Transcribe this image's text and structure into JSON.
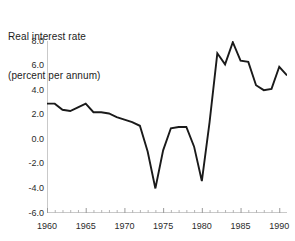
{
  "chart_data": {
    "type": "line",
    "title": "Real interest rate",
    "subtitle": "(percent per annum)",
    "title_lines": [
      "Real interest rate",
      "(percent per annum)"
    ],
    "xlabel": "",
    "ylabel": "",
    "ylim": [
      -6.0,
      8.0
    ],
    "xlim": [
      1960,
      1991
    ],
    "grid": false,
    "legend": null,
    "y_ticks": [
      8.0,
      6.0,
      4.0,
      2.0,
      0.0,
      -2.0,
      -4.0,
      -6.0
    ],
    "y_tick_labels": [
      "8.0",
      "6.0",
      "4.0",
      "2.0",
      "0.0",
      "-2.0",
      "-4.0",
      "-6.0"
    ],
    "x_ticks_major": [
      1960,
      1965,
      1970,
      1975,
      1980,
      1985,
      1990
    ],
    "x_tick_labels": [
      "1960",
      "1965",
      "1970",
      "1975",
      "1980",
      "1985",
      "1990"
    ],
    "x_minor_tick_interval": 1,
    "line_color": "#1a1a1a",
    "series": [
      {
        "name": "Real interest rate",
        "x": [
          1960,
          1961,
          1962,
          1963,
          1964,
          1965,
          1966,
          1967,
          1968,
          1969,
          1970,
          1971,
          1972,
          1973,
          1974,
          1975,
          1976,
          1977,
          1978,
          1979,
          1980,
          1981,
          1982,
          1983,
          1984,
          1985,
          1986,
          1987,
          1988,
          1989,
          1990,
          1991
        ],
        "values": [
          2.9,
          2.9,
          2.4,
          2.3,
          2.6,
          2.9,
          2.2,
          2.2,
          2.1,
          1.8,
          1.6,
          1.4,
          1.1,
          -1.0,
          -4.0,
          -0.9,
          0.9,
          1.0,
          1.0,
          -0.6,
          -3.4,
          1.4,
          7.0,
          6.1,
          7.9,
          6.4,
          6.3,
          4.4,
          4.0,
          4.1,
          5.9,
          5.2
        ]
      }
    ]
  }
}
